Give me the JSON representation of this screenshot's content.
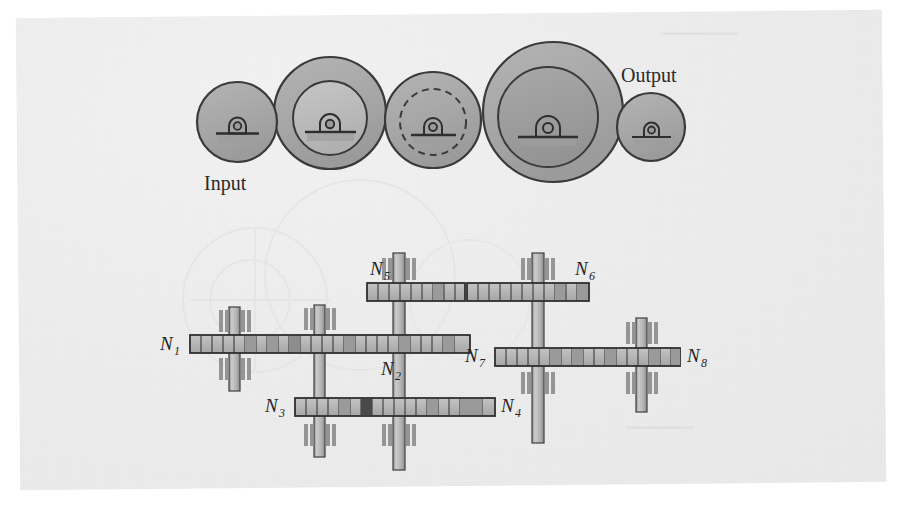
{
  "figure": {
    "kind": "engineering-diagram",
    "background_color": "#ededed",
    "ink_color": "#333333",
    "gear_fill": "#a9a9a9",
    "gear_fill_light": "#c2c2c2",
    "gear_fill_dark": "#9a9a9a",
    "tooth_fill": "#b3b3b3",
    "shaft_fill": "#b8b8b8",
    "bearing_fill": "#9e9e9e"
  },
  "top_diagram": {
    "input_label": "Input",
    "output_label": "Output",
    "wheels": [
      {
        "name": "wheel-1",
        "cx": 237,
        "cy": 122,
        "r": 40,
        "inner_r": 0,
        "inner_style": "none",
        "fill": "#a9a9a9"
      },
      {
        "name": "wheel-2",
        "cx": 330,
        "cy": 113,
        "r": 56,
        "inner_r": 37,
        "inner_style": "solid",
        "fill": "#a9a9a9"
      },
      {
        "name": "wheel-3",
        "cx": 433,
        "cy": 120,
        "r": 48,
        "inner_r": 33,
        "inner_style": "dashed",
        "fill": "#a6a6a6"
      },
      {
        "name": "wheel-4",
        "cx": 553,
        "cy": 112,
        "r": 70,
        "inner_r": 50,
        "inner_style": "solid",
        "fill": "#a9a9a9"
      },
      {
        "name": "wheel-5",
        "cx": 651,
        "cy": 127,
        "r": 34,
        "inner_r": 0,
        "inner_style": "none",
        "fill": "#a9a9a9"
      }
    ]
  },
  "gear_train": {
    "labels": [
      "N1",
      "N2",
      "N3",
      "N4",
      "N5",
      "N6",
      "N7",
      "N8"
    ],
    "label_text": {
      "N1": {
        "base": "N",
        "sub": "1"
      },
      "N2": {
        "base": "N",
        "sub": "2"
      },
      "N3": {
        "base": "N",
        "sub": "3"
      },
      "N4": {
        "base": "N",
        "sub": "4"
      },
      "N5": {
        "base": "N",
        "sub": "5"
      },
      "N6": {
        "base": "N",
        "sub": "6"
      },
      "N7": {
        "base": "N",
        "sub": "7"
      },
      "N8": {
        "base": "N",
        "sub": "8"
      }
    },
    "gear_bars": [
      {
        "name": "gear-bar-N1-N2",
        "x": 190,
        "y": 335,
        "w": 197,
        "h": 17,
        "teeth": 17
      },
      {
        "name": "gear-bar-N2-right",
        "x": 387,
        "y": 335,
        "w": 83,
        "h": 17,
        "teeth": 7
      },
      {
        "name": "gear-bar-N3-N4",
        "x": 295,
        "y": 398,
        "w": 200,
        "h": 17,
        "teeth": 18
      },
      {
        "name": "gear-bar-N5",
        "x": 367,
        "y": 283,
        "w": 98,
        "h": 17,
        "teeth": 9
      },
      {
        "name": "gear-bar-N6",
        "x": 466,
        "y": 283,
        "w": 122,
        "h": 17,
        "teeth": 11
      },
      {
        "name": "gear-bar-N7-N8",
        "x": 495,
        "y": 348,
        "w": 185,
        "h": 17,
        "teeth": 17
      }
    ],
    "shafts": [
      {
        "name": "shaft-left",
        "x": 229,
        "y": 307,
        "w": 10,
        "h": 82
      },
      {
        "name": "shaft-mid",
        "x": 314,
        "y": 305,
        "w": 10,
        "h": 152
      },
      {
        "name": "shaft-center",
        "x": 393,
        "y": 255,
        "w": 11,
        "h": 215
      },
      {
        "name": "shaft-right",
        "x": 532,
        "y": 255,
        "w": 11,
        "h": 185
      },
      {
        "name": "shaft-far-right",
        "x": 636,
        "y": 318,
        "w": 10,
        "h": 90
      }
    ]
  },
  "page_margin_notes": {
    "top_right_showthrough": "",
    "bottom_right_showthrough": ""
  }
}
